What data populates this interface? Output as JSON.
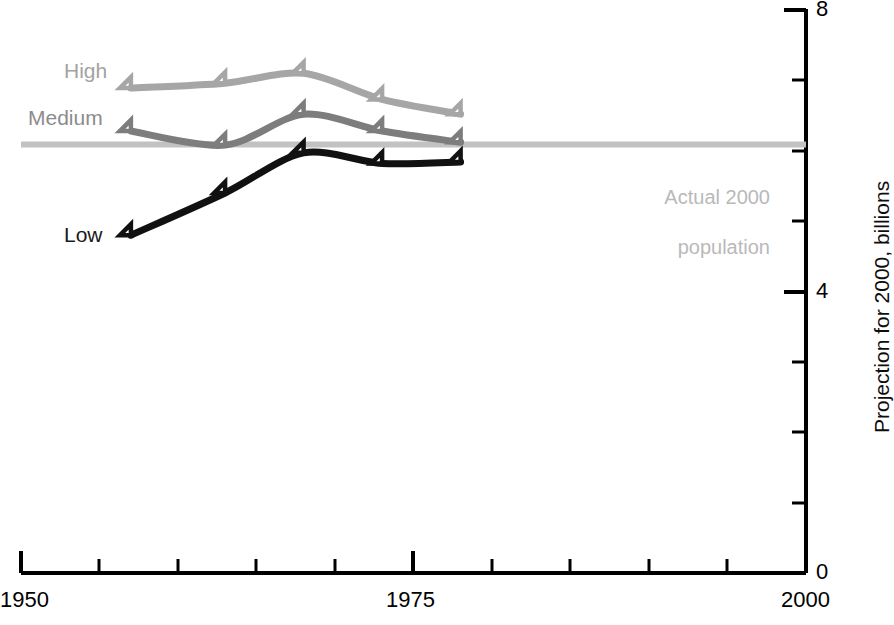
{
  "chart_data": {
    "type": "line",
    "title": "",
    "xlabel": "",
    "ylabel": "Projection for 2000, billions",
    "xlim": [
      1950,
      2000
    ],
    "ylim": [
      0,
      8
    ],
    "x_tick_labels": [
      "1950",
      "1975",
      "2000"
    ],
    "x_tick_values": [
      1950,
      1975,
      2000
    ],
    "x_minor_ticks": [
      1955,
      1960,
      1965,
      1970,
      1980,
      1985,
      1990,
      1995
    ],
    "y_tick_labels": [
      "0",
      "4",
      "8"
    ],
    "y_tick_values": [
      0,
      4,
      8
    ],
    "y_minor_ticks": [
      1,
      2,
      3,
      5,
      6,
      7
    ],
    "grid": false,
    "legend": "inline-labels",
    "x": [
      1957,
      1963,
      1968,
      1973,
      1978
    ],
    "series": [
      {
        "name": "High",
        "label": "High",
        "color": "#a6a6a6",
        "values": [
          6.89,
          6.96,
          7.1,
          6.73,
          6.52
        ]
      },
      {
        "name": "Medium",
        "label": "Medium",
        "color": "#7d7d7d",
        "values": [
          6.28,
          6.08,
          6.52,
          6.28,
          6.12
        ]
      },
      {
        "name": "Low",
        "label": "Low",
        "color": "#111111",
        "values": [
          4.8,
          5.4,
          5.97,
          5.82,
          5.84
        ]
      }
    ],
    "reference_line": {
      "name": "actual-2000-population",
      "label": "Actual 2000\npopulation",
      "value": 6.09,
      "color": "#c2c2c2",
      "x_start": 1950,
      "x_end": 2000
    },
    "annotations": [
      {
        "text": "Actual 2000\npopulation",
        "color": "#b9b9b9"
      }
    ]
  },
  "axis": {
    "y_label": "Projection for 2000, billions",
    "y_tick_top": "8",
    "y_tick_mid": "4",
    "y_tick_bottom": "0",
    "x_tick_left": "1950",
    "x_tick_mid": "1975",
    "x_tick_right": "2000",
    "axis_color": "#000000"
  },
  "labels": {
    "high": "High",
    "medium": "Medium",
    "low": "Low",
    "annotation_line1": "Actual 2000",
    "annotation_line2": "population"
  }
}
